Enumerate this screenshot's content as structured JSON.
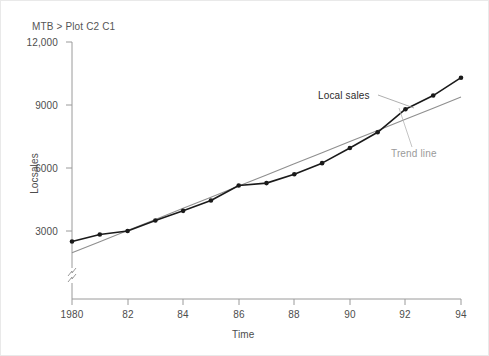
{
  "window": {
    "title": "MTB > Plot C2 C1",
    "background_color": "#ffffff",
    "border_color": "#e9e9e9"
  },
  "chart_data": {
    "type": "line",
    "title": "MTB > Plot C2 C1",
    "xlabel": "Time",
    "ylabel": "Locsales",
    "xlim": [
      1980,
      1994
    ],
    "ylim": [
      1500,
      12000
    ],
    "grid": false,
    "legend": "annotations",
    "y_axis_break": true,
    "xticks": [
      1980,
      1982,
      1984,
      1986,
      1988,
      1990,
      1992,
      1994
    ],
    "xtick_labels": [
      "1980",
      "82",
      "84",
      "86",
      "88",
      "90",
      "92",
      "94"
    ],
    "yticks": [
      3000,
      6000,
      9000,
      12000
    ],
    "ytick_labels": [
      "3000",
      "6000",
      "9000",
      "12,000"
    ],
    "x": [
      1980,
      1981,
      1982,
      1983,
      1984,
      1985,
      1986,
      1987,
      1988,
      1989,
      1990,
      1991,
      1992,
      1993,
      1994
    ],
    "series": [
      {
        "name": "Local sales",
        "color": "#1a1a1a",
        "marker": "filled-circle",
        "values": [
          2500,
          2830,
          3000,
          3500,
          3960,
          4450,
          5170,
          5280,
          5700,
          6230,
          6950,
          7700,
          8800,
          9450,
          10300
        ]
      },
      {
        "name": "Trend line",
        "color": "#8f8f8f",
        "marker": "none",
        "values": [
          1960,
          2490,
          3020,
          3550,
          4080,
          4610,
          5140,
          5670,
          6200,
          6730,
          7260,
          7790,
          8320,
          8850,
          9380
        ]
      }
    ],
    "annotations": [
      {
        "text": "Local sales",
        "color": "#2b2b2b",
        "target_x": 1991.6,
        "target_y": 8400
      },
      {
        "text": "Trend line",
        "color": "#9a9a9a",
        "target_x": 1992.2,
        "target_y": 8500
      }
    ],
    "axis_color": "#9a9a9a"
  }
}
